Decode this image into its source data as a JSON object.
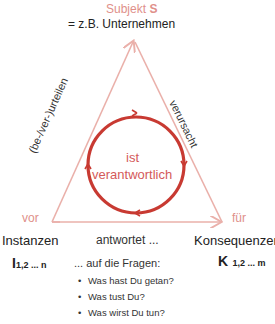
{
  "subject": {
    "label": "Subjekt",
    "symbol": "S",
    "example": "= z.B.   Unternehmen"
  },
  "edges": {
    "left": "(be-/ver-)urteilen",
    "right": "verursacht",
    "bottom": "antwortet ..."
  },
  "center": {
    "line1": "ist",
    "line2": "verantwortlich"
  },
  "left_corner": {
    "preposition": "vor",
    "label": "Instanzen",
    "symbol": "I",
    "subscript": "1,2 ... n"
  },
  "right_corner": {
    "preposition": "für",
    "label": "Konsequenzen",
    "symbol": "K",
    "subscript": "1,2 ... m"
  },
  "questions": {
    "intro": "... auf die Fragen:",
    "items": [
      "Was hast Du getan?",
      "Was tust Du?",
      "Was wirst Du tun?"
    ]
  },
  "colors": {
    "triangle": "#eab0aa",
    "circle": "#c83a32",
    "accent_text": "#e0908a"
  }
}
